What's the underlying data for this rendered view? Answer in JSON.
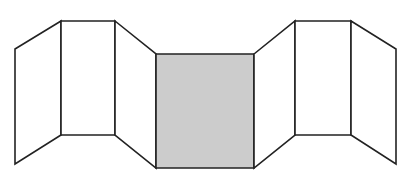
{
  "diagram": {
    "colors": {
      "background": "#ffffff",
      "stroke": "#222222",
      "panel_fill": "#ffffff",
      "highlight_fill": "#cccccc"
    },
    "panels": [
      {
        "id": "panel-1",
        "points": "15,49 61,21 61,135 15,164",
        "shaded": false
      },
      {
        "id": "panel-2",
        "points": "61,21 115,21 115,135 61,135",
        "shaded": false
      },
      {
        "id": "panel-3",
        "points": "115,21 156,54 156,168 115,135",
        "shaded": false
      },
      {
        "id": "panel-4",
        "points": "156,54 254,54 254,168 156,168",
        "shaded": true
      },
      {
        "id": "panel-5",
        "points": "254,54 295,21 295,135 254,168",
        "shaded": false
      },
      {
        "id": "panel-6",
        "points": "295,21 351,21 351,135 295,135",
        "shaded": false
      },
      {
        "id": "panel-7",
        "points": "351,21 396,49 396,164 351,135",
        "shaded": false
      }
    ]
  }
}
